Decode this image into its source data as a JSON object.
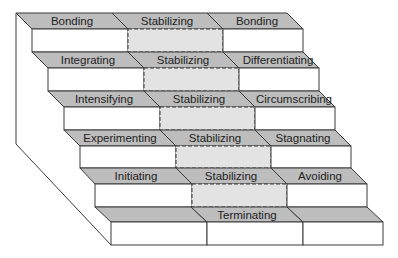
{
  "diagram": {
    "colors": {
      "top_face": "#bdbdbd",
      "stabilizing_front": "#e3e3e3",
      "front": "#ffffff",
      "line": "#3a3a3a"
    },
    "steps": [
      {
        "left": "Bonding",
        "center": "Stabilizing",
        "right": "Bonding"
      },
      {
        "left": "Integrating",
        "center": "Stabilizing",
        "right": "Differentiating"
      },
      {
        "left": "Intensifying",
        "center": "Stabilizing",
        "right": "Circumscribing"
      },
      {
        "left": "Experimenting",
        "center": "Stabilizing",
        "right": "Stagnating"
      },
      {
        "left": "Initiating",
        "center": "Stabilizing",
        "right": "Avoiding"
      },
      {
        "left": "",
        "center": "Terminating",
        "right": ""
      }
    ]
  }
}
